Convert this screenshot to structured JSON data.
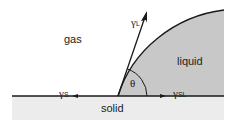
{
  "diagram": {
    "regions": {
      "gas": "gas",
      "liquid": "liquid",
      "solid": "solid"
    },
    "vectors": {
      "gamma_L": {
        "symbol": "γ",
        "sub": "L"
      },
      "gamma_S": {
        "symbol": "γ",
        "sub": "S"
      },
      "gamma_SL": {
        "symbol": "γ",
        "sub": "SL"
      }
    },
    "angle_label": "θ",
    "colors": {
      "liquid": "#c8c8c8",
      "solid": "#ececec",
      "line": "#1a1a1a"
    }
  }
}
